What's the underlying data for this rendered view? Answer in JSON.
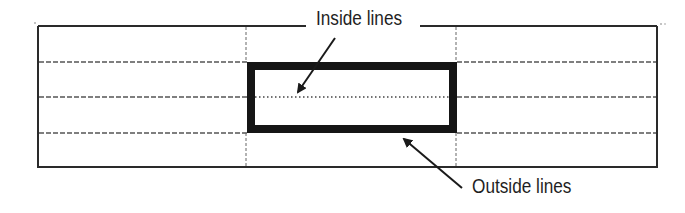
{
  "diagram": {
    "labels": {
      "inside": "Inside lines",
      "outside": "Outside lines"
    },
    "colors": {
      "line": "#2a2a2a",
      "dashed": "#555555",
      "thick_border": "#151515",
      "background": "#ffffff"
    },
    "grid": {
      "columns": 3,
      "rows": 4,
      "column_edges_x": [
        38,
        246,
        456,
        657
      ],
      "row_edges_y": [
        26,
        62,
        97,
        133,
        167
      ]
    },
    "selection": {
      "description": "Thick outside border around middle column, rows 2-3",
      "outer_box": {
        "x": 247,
        "y": 62,
        "width": 210,
        "height": 71
      },
      "border_width": 8
    },
    "arrows": [
      {
        "name": "inside-arrow",
        "from": [
          335,
          38
        ],
        "to": [
          297,
          93
        ]
      },
      {
        "name": "outside-arrow",
        "from": [
          462,
          188
        ],
        "to": [
          403,
          138
        ]
      }
    ]
  }
}
